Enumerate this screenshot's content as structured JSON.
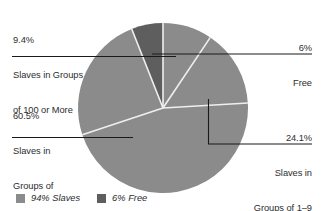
{
  "chart_data": {
    "type": "pie",
    "title": "",
    "subtitle": "",
    "xlabel": "",
    "ylabel": "",
    "grid": false,
    "legend_position": "bottom-left",
    "center": {
      "x": 163,
      "y": 108
    },
    "radius": 85,
    "start_angle_deg": -90,
    "direction": "counterclockwise",
    "categories": [
      "6% Free",
      "24.1% Slaves in Groups of 1-9",
      "60.5% Slaves in Groups of 10-99",
      "9.4% Slaves in Groups of 100 or More"
    ],
    "values": [
      6.0,
      24.1,
      60.5,
      9.4
    ],
    "colors": [
      "#5e5e5e",
      "#8b8b8b",
      "#8b8b8b",
      "#8b8b8b"
    ],
    "slices": [
      {
        "label": "6% Free",
        "percent": 6.0,
        "color": "#5e5e5e"
      },
      {
        "label": "Slaves in Groups of 1-9",
        "percent": 24.1,
        "color": "#8b8b8b"
      },
      {
        "label": "Slaves in Groups of 10-99",
        "percent": 60.5,
        "color": "#8b8b8b"
      },
      {
        "label": "Slaves in Groups of 100 or More",
        "percent": 9.4,
        "color": "#8b8b8b"
      }
    ],
    "legend": [
      {
        "label": "94% Slaves",
        "color": "#8b8b8b"
      },
      {
        "label": "6% Free",
        "color": "#5e5e5e"
      }
    ]
  },
  "labels": {
    "groups_100_plus": {
      "percent": "9.4%",
      "line1": "Slaves in Groups",
      "line2": "of 100 or More"
    },
    "groups_10_99": {
      "percent": "60.5%",
      "line1": "Slaves in",
      "line2": "Groups of",
      "line3": "10–99"
    },
    "free": {
      "percent": "6%",
      "line1": "Free"
    },
    "groups_1_9": {
      "percent": "24.1%",
      "line1": "Slaves in",
      "line2": "Groups of 1–9"
    }
  },
  "legend": {
    "slaves": {
      "label": "94% Slaves",
      "color": "#8b8b8b"
    },
    "free": {
      "label": "6% Free",
      "color": "#5e5e5e"
    }
  },
  "colors": {
    "slaves_fill": "#8b8b8b",
    "free_fill": "#5e5e5e",
    "slice_divider": "#efefef",
    "leader_line": "#1a1a1a",
    "text": "#2d2d2d",
    "background": "#ffffff"
  }
}
